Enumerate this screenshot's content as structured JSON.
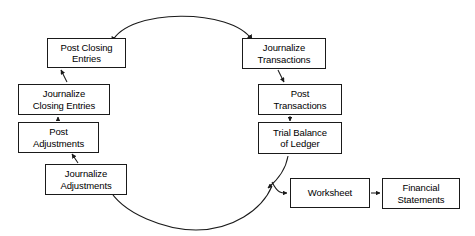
{
  "diagram": {
    "direction": "counter-clockwise",
    "stroke_color": "#1a1a1a",
    "background_color": "#ffffff",
    "nodes": [
      {
        "id": "post-closing-entries",
        "label": "Post Closing\nEntries",
        "x": 47,
        "y": 38,
        "w": 79,
        "h": 30
      },
      {
        "id": "journalize-closing-entries",
        "label": "Journalize\nClosing Entries",
        "x": 18,
        "y": 84,
        "w": 92,
        "h": 31
      },
      {
        "id": "post-adjustments",
        "label": "Post\nAdjustments",
        "x": 18,
        "y": 122,
        "w": 81,
        "h": 31
      },
      {
        "id": "journalize-adjustments",
        "label": "Journalize\nAdjustments",
        "x": 45,
        "y": 164,
        "w": 82,
        "h": 31
      },
      {
        "id": "journalize-transactions",
        "label": "Journalize\nTransactions",
        "x": 242,
        "y": 38,
        "w": 84,
        "h": 31
      },
      {
        "id": "post-transactions",
        "label": "Post\nTransactions",
        "x": 258,
        "y": 84,
        "w": 84,
        "h": 31
      },
      {
        "id": "trial-balance-of-ledger",
        "label": "Trial Balance\nof Ledger",
        "x": 258,
        "y": 122,
        "w": 84,
        "h": 32
      },
      {
        "id": "worksheet",
        "label": "Worksheet",
        "x": 290,
        "y": 178,
        "w": 80,
        "h": 30
      },
      {
        "id": "financial-statements",
        "label": "Financial\nStatements",
        "x": 382,
        "y": 178,
        "w": 78,
        "h": 31
      }
    ],
    "edges": [
      {
        "id": "edge-journalize-closing-to-post-closing",
        "from": "journalize-closing-entries",
        "to": "post-closing-entries"
      },
      {
        "id": "edge-post-adjustments-to-journalize-closing",
        "from": "post-adjustments",
        "to": "journalize-closing-entries"
      },
      {
        "id": "edge-journalize-adjustments-to-post-adjustments",
        "from": "journalize-adjustments",
        "to": "post-adjustments"
      },
      {
        "id": "edge-journalize-transactions-to-post-transactions",
        "from": "journalize-transactions",
        "to": "post-transactions"
      },
      {
        "id": "edge-post-transactions-to-trial-balance",
        "from": "post-transactions",
        "to": "trial-balance-of-ledger"
      },
      {
        "id": "edge-trial-balance-to-worksheet",
        "from": "trial-balance-of-ledger",
        "to": "worksheet"
      },
      {
        "id": "edge-worksheet-to-financial-statements",
        "from": "worksheet",
        "to": "financial-statements"
      },
      {
        "id": "edge-arc-top",
        "from": "post-closing-entries",
        "to": "journalize-transactions"
      },
      {
        "id": "edge-arc-bottom",
        "from": "trial-balance-of-ledger",
        "to": "journalize-adjustments"
      }
    ]
  }
}
